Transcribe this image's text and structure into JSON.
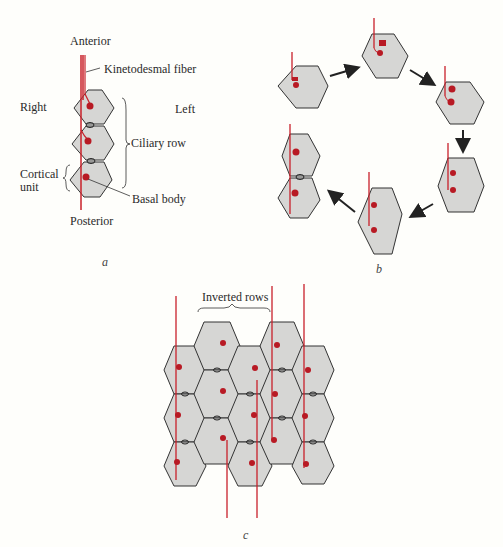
{
  "colors": {
    "cell_fill": "#d6d6d4",
    "cell_stroke": "#333333",
    "fiber": "#c8202a",
    "basal_body": "#b81a24",
    "background": "#fefefb"
  },
  "panel_a": {
    "caption": "a",
    "labels": {
      "anterior": "Anterior",
      "kinetodesmal_fiber": "Kinetodesmal fiber",
      "right": "Right",
      "left": "Left",
      "ciliary_row": "Ciliary row",
      "cortical_unit_1": "Cortical",
      "cortical_unit_2": "unit",
      "basal_body": "Basal body",
      "posterior": "Posterior"
    }
  },
  "panel_b": {
    "caption": "b",
    "description": "Six-stage cycle of cortical unit division, arrows clockwise"
  },
  "panel_c": {
    "caption": "c",
    "labels": {
      "inverted_rows": "Inverted rows"
    }
  }
}
